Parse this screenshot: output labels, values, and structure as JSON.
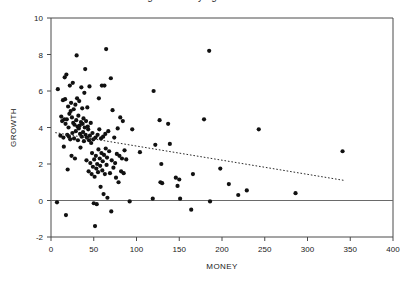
{
  "figure": {
    "title_cropped": "Figure: Money against Growth",
    "background": "#ffffff",
    "point_color": "#111111",
    "axis_color": "#4a4a4a",
    "zero_line_color": "#6a6a6a",
    "trend_line_color": "#2b2b2b"
  },
  "chart_data": {
    "type": "scatter",
    "title": "",
    "xlabel": "MONEY",
    "ylabel": "GROWTH",
    "xlim": [
      0,
      400
    ],
    "ylim": [
      -2,
      10
    ],
    "xticks": [
      0,
      50,
      100,
      150,
      200,
      250,
      300,
      350,
      400
    ],
    "xtick_labels": [
      "0",
      "50",
      "100",
      "150",
      "200",
      "250",
      "300",
      "350",
      "400"
    ],
    "yticks": [
      -2,
      0,
      2,
      4,
      6,
      8,
      10
    ],
    "ytick_labels": [
      "-2",
      "0",
      "2",
      "4",
      "6",
      "8",
      "10"
    ],
    "grid": false,
    "legend": null,
    "reference_lines": [
      {
        "name": "zero-growth-line",
        "orientation": "horizontal",
        "y": 0,
        "style": "solid"
      }
    ],
    "trend_line": {
      "name": "regression-line",
      "style": "dotted",
      "x_start": 5,
      "y_start": 3.72,
      "x_end": 343,
      "y_end": 1.1,
      "slope": -0.00775,
      "intercept": 3.76
    },
    "points": [
      [
        7.0,
        -0.1
      ],
      [
        8.0,
        6.1
      ],
      [
        11.0,
        3.55
      ],
      [
        12.0,
        4.6
      ],
      [
        13.0,
        4.35
      ],
      [
        14.0,
        5.5
      ],
      [
        14.5,
        3.45
      ],
      [
        15.0,
        2.95
      ],
      [
        15.5,
        4.45
      ],
      [
        16.0,
        6.75
      ],
      [
        16.5,
        5.55
      ],
      [
        17.0,
        4.2
      ],
      [
        17.5,
        -0.8
      ],
      [
        18.0,
        6.9
      ],
      [
        18.5,
        4.45
      ],
      [
        19.0,
        3.6
      ],
      [
        19.5,
        1.7
      ],
      [
        20.0,
        5.15
      ],
      [
        20.5,
        4.0
      ],
      [
        21.0,
        3.5
      ],
      [
        21.5,
        4.75
      ],
      [
        22.0,
        6.3
      ],
      [
        22.5,
        3.35
      ],
      [
        23.0,
        4.9
      ],
      [
        23.5,
        5.35
      ],
      [
        24.0,
        2.45
      ],
      [
        24.5,
        4.55
      ],
      [
        25.0,
        3.7
      ],
      [
        25.5,
        6.45
      ],
      [
        26.0,
        4.25
      ],
      [
        26.5,
        5.0
      ],
      [
        27.0,
        3.4
      ],
      [
        27.5,
        4.15
      ],
      [
        28.0,
        2.3
      ],
      [
        28.5,
        5.25
      ],
      [
        29.0,
        3.8
      ],
      [
        29.5,
        4.4
      ],
      [
        30.0,
        7.95
      ],
      [
        30.5,
        5.6
      ],
      [
        31.0,
        4.05
      ],
      [
        31.5,
        3.3
      ],
      [
        32.0,
        4.65
      ],
      [
        32.5,
        3.95
      ],
      [
        33.0,
        5.45
      ],
      [
        33.5,
        4.1
      ],
      [
        34.0,
        3.65
      ],
      [
        34.5,
        2.9
      ],
      [
        35.0,
        4.3
      ],
      [
        35.5,
        6.2
      ],
      [
        36.0,
        3.5
      ],
      [
        36.5,
        5.05
      ],
      [
        37.0,
        4.2
      ],
      [
        37.5,
        3.75
      ],
      [
        38.0,
        4.5
      ],
      [
        38.5,
        3.25
      ],
      [
        39.0,
        5.9
      ],
      [
        39.5,
        4.0
      ],
      [
        40.0,
        7.2
      ],
      [
        40.5,
        3.6
      ],
      [
        41.0,
        4.35
      ],
      [
        41.5,
        2.2
      ],
      [
        42.0,
        3.45
      ],
      [
        42.5,
        5.1
      ],
      [
        43.0,
        4.05
      ],
      [
        43.5,
        3.9
      ],
      [
        44.0,
        1.6
      ],
      [
        44.5,
        3.3
      ],
      [
        45.0,
        6.25
      ],
      [
        45.5,
        3.55
      ],
      [
        46.0,
        2.05
      ],
      [
        46.5,
        4.25
      ],
      [
        47.0,
        3.15
      ],
      [
        47.5,
        1.45
      ],
      [
        48.0,
        2.6
      ],
      [
        48.5,
        3.7
      ],
      [
        49.0,
        1.85
      ],
      [
        49.5,
        3.35
      ],
      [
        50.0,
        -0.15
      ],
      [
        50.5,
        2.25
      ],
      [
        51.0,
        1.3
      ],
      [
        51.5,
        -1.4
      ],
      [
        52.0,
        3.45
      ],
      [
        52.5,
        2.45
      ],
      [
        53.0,
        1.75
      ],
      [
        53.5,
        -0.2
      ],
      [
        54.0,
        2.0
      ],
      [
        54.5,
        3.6
      ],
      [
        55.0,
        1.55
      ],
      [
        55.5,
        2.8
      ],
      [
        56.0,
        5.6
      ],
      [
        56.5,
        3.9
      ],
      [
        57.0,
        2.3
      ],
      [
        57.5,
        1.9
      ],
      [
        58.0,
        0.75
      ],
      [
        58.5,
        3.4
      ],
      [
        59.0,
        2.6
      ],
      [
        59.5,
        6.3
      ],
      [
        60.0,
        1.65
      ],
      [
        60.5,
        2.15
      ],
      [
        61.0,
        3.5
      ],
      [
        61.5,
        0.35
      ],
      [
        62.0,
        2.5
      ],
      [
        62.5,
        6.3
      ],
      [
        63.0,
        1.45
      ],
      [
        63.5,
        3.65
      ],
      [
        64.0,
        2.85
      ],
      [
        64.5,
        8.3
      ],
      [
        65.0,
        1.95
      ],
      [
        65.5,
        2.35
      ],
      [
        66.0,
        0.15
      ],
      [
        67.0,
        3.8
      ],
      [
        68.0,
        2.7
      ],
      [
        69.0,
        1.5
      ],
      [
        70.0,
        6.7
      ],
      [
        70.5,
        -0.6
      ],
      [
        71.0,
        2.2
      ],
      [
        72.0,
        4.95
      ],
      [
        73.0,
        1.8
      ],
      [
        74.0,
        3.45
      ],
      [
        75.0,
        2.05
      ],
      [
        76.0,
        1.25
      ],
      [
        77.0,
        2.55
      ],
      [
        78.0,
        3.95
      ],
      [
        79.0,
        1.0
      ],
      [
        80.0,
        2.45
      ],
      [
        81.0,
        4.55
      ],
      [
        82.0,
        1.6
      ],
      [
        83.0,
        2.3
      ],
      [
        84.0,
        4.35
      ],
      [
        85.0,
        1.5
      ],
      [
        86.0,
        2.75
      ],
      [
        88.0,
        2.25
      ],
      [
        92.0,
        -0.05
      ],
      [
        95.0,
        3.9
      ],
      [
        104.0,
        2.65
      ],
      [
        119.0,
        0.1
      ],
      [
        120.0,
        6.0
      ],
      [
        122.0,
        3.05
      ],
      [
        127.0,
        4.4
      ],
      [
        128.0,
        1.0
      ],
      [
        129.0,
        2.0
      ],
      [
        130.0,
        0.95
      ],
      [
        137.0,
        4.2
      ],
      [
        139.0,
        3.1
      ],
      [
        146.0,
        1.25
      ],
      [
        148.0,
        0.8
      ],
      [
        150.0,
        1.15
      ],
      [
        151.0,
        0.1
      ],
      [
        164.0,
        -0.5
      ],
      [
        166.0,
        1.45
      ],
      [
        179.0,
        4.45
      ],
      [
        185.0,
        8.2
      ],
      [
        186.0,
        -0.05
      ],
      [
        198.0,
        1.75
      ],
      [
        208.0,
        0.9
      ],
      [
        219.0,
        0.3
      ],
      [
        229.0,
        0.55
      ],
      [
        243.0,
        3.9
      ],
      [
        286.0,
        0.4
      ],
      [
        341.0,
        2.7
      ]
    ]
  }
}
